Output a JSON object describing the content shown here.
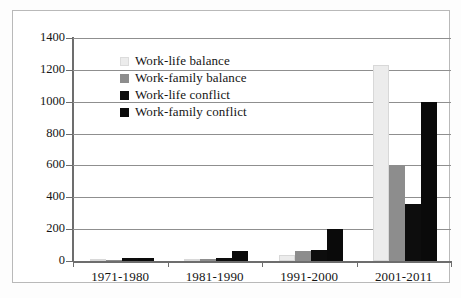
{
  "chart_data": {
    "type": "bar",
    "title": "",
    "subtitle": "",
    "xlabel": "",
    "ylabel": "",
    "categories": [
      "1971-1980",
      "1981-1990",
      "1991-2000",
      "2001-2011"
    ],
    "series": [
      {
        "name": "Work-life balance",
        "color": "#ececec",
        "values": [
          3,
          5,
          40,
          1230
        ]
      },
      {
        "name": "Work-family balance",
        "color": "#8d8d8d",
        "values": [
          5,
          10,
          60,
          600
        ]
      },
      {
        "name": "Work-life conflict",
        "color": "#0d0d0d",
        "values": [
          20,
          20,
          70,
          360
        ]
      },
      {
        "name": "Work-family conflict",
        "color": "#0a0a0a",
        "values": [
          20,
          60,
          200,
          1000
        ]
      }
    ],
    "ylim": [
      0,
      1400
    ],
    "ytick_step": 200,
    "yticks": [
      0,
      200,
      400,
      600,
      800,
      1000,
      1200,
      1400
    ],
    "ytick_labels": [
      "0",
      "200",
      "400",
      "600",
      "800",
      "1000",
      "1200",
      "1400"
    ],
    "grid": true,
    "grid_axis": "y",
    "legend_position": "inside-top-left",
    "frame": true
  },
  "legend": {
    "entries": [
      {
        "label": "Work-life balance"
      },
      {
        "label": "Work-family balance"
      },
      {
        "label": "Work-life conflict"
      },
      {
        "label": "Work-family conflict"
      }
    ]
  }
}
